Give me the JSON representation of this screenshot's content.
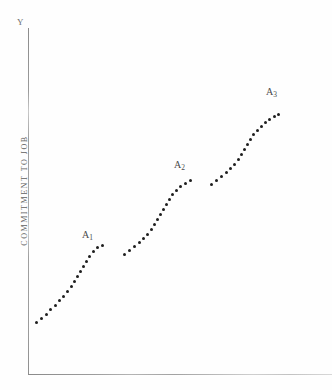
{
  "figure": {
    "width": 332,
    "height": 390,
    "background": "#ffffff",
    "ink_color": "#1e1e1e",
    "axis_color": "#9a9a9a"
  },
  "axes": {
    "y_top_marker": "Y",
    "y_title": "COMMITMENT TO JOB",
    "x_title": "",
    "y_axis_name": "y-axis-line",
    "x_axis_name": "x-axis-line"
  },
  "annotations": [
    {
      "name": "segment-label-a1",
      "text": "A",
      "subscript": "1",
      "x": 82,
      "y": 229
    },
    {
      "name": "segment-label-a2",
      "text": "A",
      "subscript": "2",
      "x": 174,
      "y": 159
    },
    {
      "name": "segment-label-a3",
      "text": "A",
      "subscript": "3",
      "x": 266,
      "y": 86
    }
  ],
  "chart_data": {
    "type": "scatter",
    "title": "",
    "subtitle": "",
    "xlabel": "",
    "ylabel": "COMMITMENT TO JOB",
    "legend": [],
    "legend_position": "none",
    "grid": false,
    "xlim": [
      0,
      332
    ],
    "ylim": [
      0,
      390
    ],
    "axis_note": "Unlabeled axes; y-axis marked 'Y' at top, titled 'COMMITMENT TO JOB'. No tick marks or tick labels are printed.",
    "series": [
      {
        "name": "A1",
        "label": "A₁",
        "marker": "dot",
        "points": [
          [
            36,
            322
          ],
          [
            41,
            318
          ],
          [
            46,
            314
          ],
          [
            50,
            309
          ],
          [
            55,
            305
          ],
          [
            59,
            300
          ],
          [
            63,
            296
          ],
          [
            67,
            291
          ],
          [
            71,
            286
          ],
          [
            74,
            281
          ],
          [
            77,
            276
          ],
          [
            80,
            271
          ],
          [
            83,
            266
          ],
          [
            86,
            261
          ],
          [
            89,
            256
          ],
          [
            93,
            251
          ],
          [
            97,
            247
          ],
          [
            102,
            245
          ]
        ]
      },
      {
        "name": "A2",
        "label": "A₂",
        "marker": "dot",
        "points": [
          [
            124,
            254
          ],
          [
            129,
            250
          ],
          [
            134,
            246
          ],
          [
            139,
            242
          ],
          [
            143,
            238
          ],
          [
            147,
            234
          ],
          [
            151,
            229
          ],
          [
            154,
            224
          ],
          [
            157,
            219
          ],
          [
            160,
            214
          ],
          [
            163,
            209
          ],
          [
            166,
            204
          ],
          [
            169,
            199
          ],
          [
            172,
            194
          ],
          [
            176,
            190
          ],
          [
            180,
            186
          ],
          [
            185,
            183
          ],
          [
            190,
            180
          ]
        ]
      },
      {
        "name": "A3",
        "label": "A₃",
        "marker": "dot",
        "points": [
          [
            211,
            184
          ],
          [
            216,
            180
          ],
          [
            221,
            176
          ],
          [
            226,
            172
          ],
          [
            230,
            168
          ],
          [
            234,
            164
          ],
          [
            238,
            159
          ],
          [
            241,
            154
          ],
          [
            244,
            149
          ],
          [
            247,
            144
          ],
          [
            250,
            139
          ],
          [
            253,
            134
          ],
          [
            257,
            130
          ],
          [
            261,
            126
          ],
          [
            265,
            122
          ],
          [
            269,
            119
          ],
          [
            274,
            116
          ],
          [
            278,
            114
          ]
        ]
      }
    ]
  }
}
